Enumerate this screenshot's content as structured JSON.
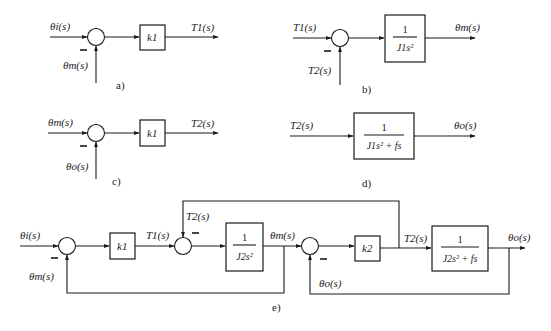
{
  "diagrams": {
    "a": {
      "caption": "a)",
      "input_label": "θi(s)",
      "feedback_label": "θm(s)",
      "block_gain": "k1",
      "output_label": "T1(s)",
      "feedback_sign": "−"
    },
    "b": {
      "caption": "b)",
      "input_label": "T1(s)",
      "feedback_label": "T2(s)",
      "block_num": "1",
      "block_den": "J1s²",
      "output_label": "θm(s)",
      "feedback_sign": "−"
    },
    "c": {
      "caption": "c)",
      "input_label": "θm(s)",
      "feedback_label": "θo(s)",
      "block_gain": "k1",
      "output_label": "T2(s)",
      "feedback_sign": "−"
    },
    "d": {
      "caption": "d)",
      "input_label": "T2(s)",
      "block_num": "1",
      "block_den": "J1s² + fs",
      "output_label": "θo(s)"
    },
    "e": {
      "caption": "e)",
      "input_label": "θi(s)",
      "feedback1_label": "θm(s)",
      "block1_gain": "k1",
      "signal_T1": "T1(s)",
      "feedback2_label": "T2(s)",
      "block2_num": "1",
      "block2_den": "J2s²",
      "signal_theta_m": "θm(s)",
      "block3_gain": "k2",
      "signal_T2": "T2(s)",
      "block4_num": "1",
      "block4_den": "J2s² + fs",
      "output_label": "θo(s)",
      "feedback3_label": "θo(s)",
      "feedback_sign": "−"
    }
  }
}
